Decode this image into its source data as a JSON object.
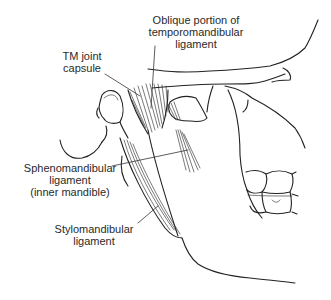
{
  "figure": {
    "labels": {
      "oblique_portion": [
        "Oblique portion of",
        "temporomandibular",
        "ligament"
      ],
      "tm_joint_capsule": [
        "TM joint",
        "capsule"
      ],
      "sphenomandibular": [
        "Sphenomandibular",
        "ligament",
        "(inner mandible)"
      ],
      "stylomandibular": [
        "Stylomandibular",
        "ligament"
      ]
    },
    "colors": {
      "line": "#222222",
      "text": "#2a2a2a",
      "background": "#ffffff"
    }
  }
}
